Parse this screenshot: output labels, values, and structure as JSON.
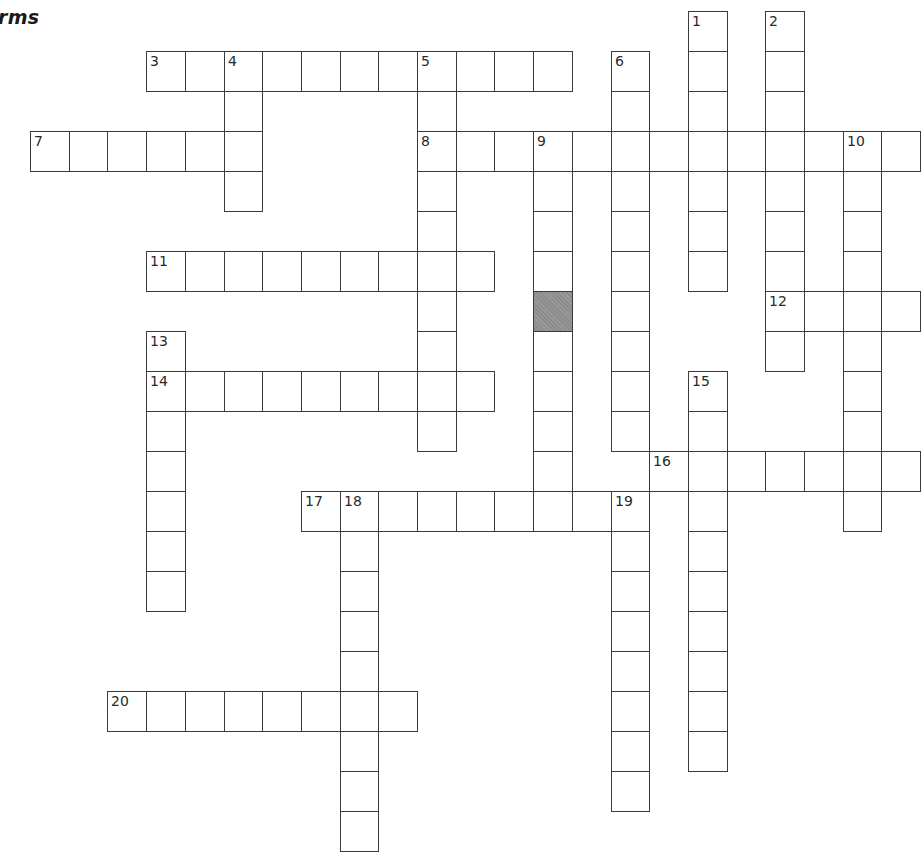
{
  "title": "rms",
  "grid": {
    "origin_x": 30,
    "origin_y": 11,
    "cell_w": 38.7,
    "cell_h": 40,
    "shaded_color": "#8d8d8d",
    "shaded_cells": [
      [
        7,
        13
      ]
    ]
  },
  "entries": [
    {
      "number": "1",
      "direction": "down",
      "row": 0,
      "col": 17,
      "length": 7
    },
    {
      "number": "2",
      "direction": "down",
      "row": 0,
      "col": 19,
      "length": 9
    },
    {
      "number": "3",
      "direction": "across",
      "row": 1,
      "col": 3,
      "length": 11
    },
    {
      "number": "4",
      "direction": "down",
      "row": 1,
      "col": 5,
      "length": 4
    },
    {
      "number": "5",
      "direction": "down",
      "row": 1,
      "col": 10,
      "length": 10
    },
    {
      "number": "6",
      "direction": "down",
      "row": 1,
      "col": 15,
      "length": 10
    },
    {
      "number": "7",
      "direction": "across",
      "row": 3,
      "col": 0,
      "length": 6
    },
    {
      "number": "8",
      "direction": "across",
      "row": 3,
      "col": 10,
      "length": 13
    },
    {
      "number": "9",
      "direction": "down",
      "row": 3,
      "col": 13,
      "length": 10
    },
    {
      "number": "10",
      "direction": "down",
      "row": 3,
      "col": 21,
      "length": 10
    },
    {
      "number": "11",
      "direction": "across",
      "row": 6,
      "col": 3,
      "length": 9
    },
    {
      "number": "12",
      "direction": "across",
      "row": 7,
      "col": 19,
      "length": 4
    },
    {
      "number": "13",
      "direction": "down",
      "row": 8,
      "col": 3,
      "length": 7
    },
    {
      "number": "14",
      "direction": "across",
      "row": 9,
      "col": 3,
      "length": 9
    },
    {
      "number": "15",
      "direction": "down",
      "row": 9,
      "col": 17,
      "length": 10
    },
    {
      "number": "16",
      "direction": "across",
      "row": 11,
      "col": 16,
      "length": 7
    },
    {
      "number": "17",
      "direction": "across",
      "row": 12,
      "col": 7,
      "length": 9
    },
    {
      "number": "18",
      "direction": "down",
      "row": 12,
      "col": 8,
      "length": 9
    },
    {
      "number": "19",
      "direction": "down",
      "row": 12,
      "col": 15,
      "length": 8
    },
    {
      "number": "20",
      "direction": "across",
      "row": 17,
      "col": 2,
      "length": 8
    }
  ]
}
